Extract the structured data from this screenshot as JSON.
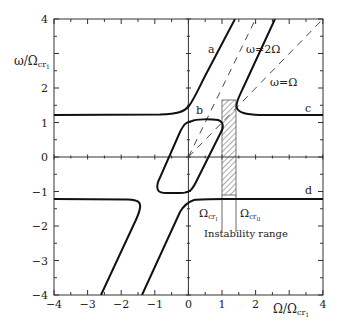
{
  "chart_data": {
    "type": "line",
    "title": "",
    "xlabel": "Ω/Ω_cr1",
    "ylabel": "ω/Ω_cr1",
    "xlim": [
      -4,
      4
    ],
    "ylim": [
      -4,
      4
    ],
    "xticks": [
      "-4",
      "-3",
      "-2",
      "-1",
      "0",
      "1",
      "2",
      "4"
    ],
    "yticks": [
      "-4",
      "-3",
      "-2",
      "-1",
      "0",
      "1",
      "2",
      "4"
    ],
    "grid": false,
    "axes_zero_lines": true,
    "series": [
      {
        "name": "a",
        "style": "solid",
        "points": [
          [
            -4,
            1.22
          ],
          [
            -0.5,
            1.25
          ],
          [
            -0.05,
            1.4
          ],
          [
            0.3,
            1.9
          ],
          [
            1.4,
            4.0
          ]
        ]
      },
      {
        "name": "b",
        "style": "solid-closed-loop",
        "points": [
          [
            0.05,
            1.1
          ],
          [
            0.9,
            1.05
          ],
          [
            1.0,
            0.85
          ],
          [
            0.0,
            -1.0
          ],
          [
            -0.9,
            -1.0
          ],
          [
            -0.95,
            -0.8
          ],
          [
            0.0,
            1.0
          ]
        ]
      },
      {
        "name": "c",
        "style": "solid",
        "points": [
          [
            2.6,
            4.0
          ],
          [
            1.6,
            1.7
          ],
          [
            1.42,
            1.35
          ],
          [
            1.9,
            1.22
          ],
          [
            4,
            1.22
          ]
        ]
      },
      {
        "name": "d",
        "style": "solid",
        "points": [
          [
            -1.4,
            -4.0
          ],
          [
            -0.3,
            -1.6
          ],
          [
            0.05,
            -1.3
          ],
          [
            0.6,
            -1.22
          ],
          [
            4,
            -1.22
          ]
        ]
      },
      {
        "name": "lower-left",
        "style": "solid",
        "points": [
          [
            -4,
            -1.22
          ],
          [
            -1.6,
            -1.25
          ],
          [
            -1.45,
            -1.5
          ],
          [
            -2.6,
            -4.0
          ]
        ]
      },
      {
        "name": "ω=2Ω",
        "style": "dashed",
        "points": [
          [
            0,
            0
          ],
          [
            2,
            4
          ]
        ]
      },
      {
        "name": "ω=Ω",
        "style": "dashed",
        "points": [
          [
            0,
            0
          ],
          [
            4,
            4
          ]
        ]
      }
    ],
    "shaded_region": {
      "label": "Instability range",
      "x": [
        1.0,
        1.41
      ],
      "y": [
        -1.1,
        1.65
      ],
      "pattern": "hatched"
    },
    "annotations": [
      {
        "text": "a",
        "x": 0.7,
        "y": 3.35
      },
      {
        "text": "b",
        "x": 0.25,
        "y": 1.35
      },
      {
        "text": "c",
        "x": 3.45,
        "y": 1.4
      },
      {
        "text": "d",
        "x": 3.45,
        "y": -1.0
      },
      {
        "text": "ω=2Ω",
        "x": 2.1,
        "y": 3.1
      },
      {
        "text": "ω=Ω",
        "x": 2.8,
        "y": 2.1
      },
      {
        "text": "Ω_cr1",
        "x": 0.65,
        "y": -1.65
      },
      {
        "text": "Ω_crII",
        "x": 1.45,
        "y": -1.65
      },
      {
        "text": "Instability range",
        "x": 0.95,
        "y": -2.3
      }
    ]
  },
  "labels": {
    "ylabel_main": "ω/Ω",
    "ylabel_sub": "cr",
    "ylabel_subsub": "1",
    "xlabel_main": "Ω/Ω",
    "xlabel_sub": "cr",
    "xlabel_subsub": "1",
    "curve_a": "a",
    "curve_b": "b",
    "curve_c": "c",
    "curve_d": "d",
    "line_2omega": "ω=2Ω",
    "line_omega": "ω=Ω",
    "omega_cr1_main": "Ω",
    "omega_cr1_sub": "cr",
    "omega_cr1_subsub": "I",
    "omega_cr2_main": "Ω",
    "omega_cr2_sub": "cr",
    "omega_cr2_subsub": "II",
    "instability": "Instability range"
  },
  "ticks": {
    "x": [
      "−4",
      "−3",
      "−2",
      "−1",
      "0",
      "1",
      "2",
      "4"
    ],
    "y": [
      "4",
      "2",
      "1",
      "0",
      "−1",
      "−2",
      "−3",
      "−4"
    ]
  }
}
